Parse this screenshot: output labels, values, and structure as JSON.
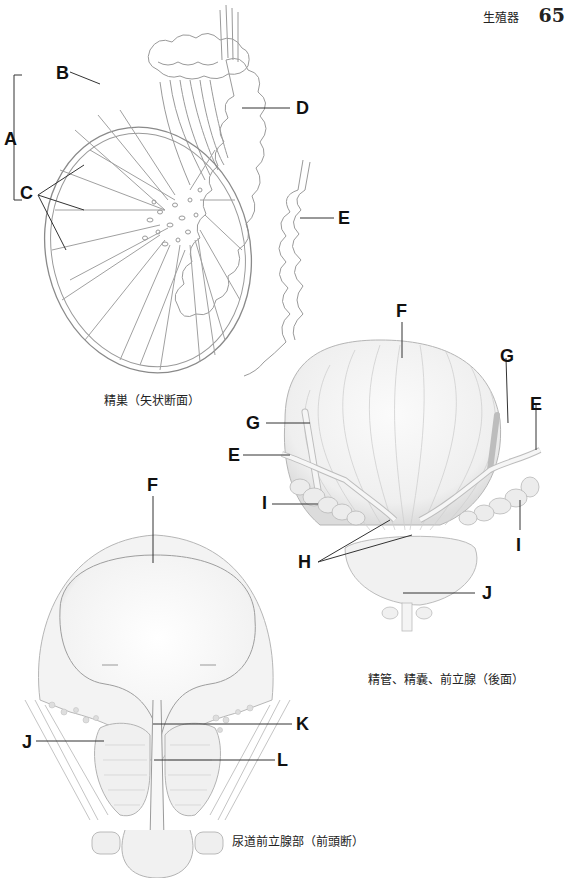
{
  "header": {
    "chapter": "生殖器",
    "page_number": "65"
  },
  "figures": [
    {
      "id": "testis",
      "caption": "精巣（矢状断面）",
      "labels": {
        "A": "A",
        "B": "B",
        "C": "C",
        "D": "D",
        "E": "E"
      }
    },
    {
      "id": "bladder-posterior",
      "caption": "精管、精嚢、前立腺（後面）",
      "labels": {
        "F": "F",
        "G1": "G",
        "G2": "G",
        "E1": "E",
        "E2": "E",
        "I1": "I",
        "I2": "I",
        "H": "H",
        "J": "J"
      }
    },
    {
      "id": "prostatic-urethra",
      "caption": "尿道前立腺部（前頭断）",
      "labels": {
        "F": "F",
        "J": "J",
        "K": "K",
        "L": "L"
      }
    }
  ]
}
